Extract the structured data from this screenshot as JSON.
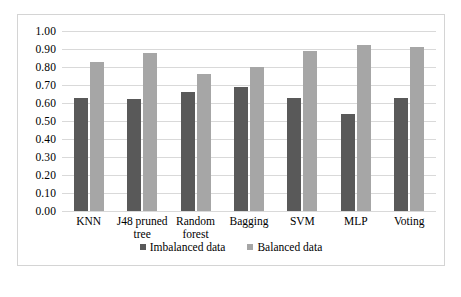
{
  "chart_data": {
    "type": "bar",
    "title": "",
    "subtitle": "",
    "xlabel": "",
    "ylabel": "",
    "ylim": [
      0.0,
      1.0
    ],
    "ytick_step": 0.1,
    "ytick_labels": [
      "1.00",
      "0.90",
      "0.80",
      "0.70",
      "0.60",
      "0.50",
      "0.40",
      "0.30",
      "0.20",
      "0.10",
      "0.00"
    ],
    "ytick_values": [
      1.0,
      0.9,
      0.8,
      0.7,
      0.6,
      0.5,
      0.4,
      0.3,
      0.2,
      0.1,
      0.0
    ],
    "grid": true,
    "legend_position": "bottom",
    "categories": [
      "KNN",
      "J48 pruned tree",
      "Random forest",
      "Bagging",
      "SVM",
      "MLP",
      "Voting"
    ],
    "series": [
      {
        "name": "Imbalanced data",
        "color": "#595959",
        "values": [
          0.63,
          0.62,
          0.66,
          0.69,
          0.63,
          0.54,
          0.63
        ]
      },
      {
        "name": "Balanced data",
        "color": "#a6a6a6",
        "values": [
          0.83,
          0.88,
          0.76,
          0.8,
          0.89,
          0.92,
          0.91
        ]
      }
    ]
  },
  "legend": {
    "entries": [
      {
        "label": "Imbalanced data",
        "marker": "square-marker-dark"
      },
      {
        "label": "Balanced data",
        "marker": "square-marker-light"
      }
    ]
  }
}
